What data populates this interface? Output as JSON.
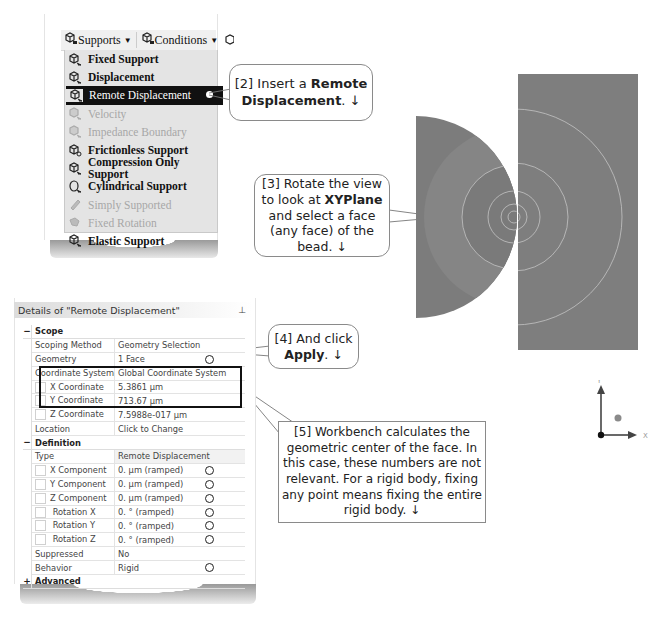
{
  "menu": {
    "toolbar": [
      {
        "label": "Supports",
        "icon": "supports-icon"
      },
      {
        "label": "Conditions",
        "icon": "conditions-icon"
      }
    ],
    "items": [
      {
        "label": "Fixed Support",
        "enabled": true,
        "selected": false
      },
      {
        "label": "Displacement",
        "enabled": true,
        "selected": false
      },
      {
        "label": "Remote Displacement",
        "enabled": true,
        "selected": true
      },
      {
        "label": "Velocity",
        "enabled": false,
        "selected": false
      },
      {
        "label": "Impedance Boundary",
        "enabled": false,
        "selected": false
      },
      {
        "label": "Frictionless Support",
        "enabled": true,
        "selected": false
      },
      {
        "label": "Compression Only Support",
        "enabled": true,
        "selected": false
      },
      {
        "label": "Cylindrical Support",
        "enabled": true,
        "selected": false
      },
      {
        "label": "Simply Supported",
        "enabled": false,
        "selected": false
      },
      {
        "label": "Fixed Rotation",
        "enabled": false,
        "selected": false
      },
      {
        "label": "Elastic Support",
        "enabled": true,
        "selected": false
      }
    ]
  },
  "callouts": {
    "c2": {
      "pre": "[2] Insert a ",
      "bold": "Remote Displacement",
      "post": ". ↓"
    },
    "c3": {
      "pre": "[3] Rotate the view to look at ",
      "bold": "XYPlane",
      "post": " and select a face (any face) of the bead. ↓"
    },
    "c4": {
      "pre": "[4] And click ",
      "bold": "Apply",
      "post": ". ↓"
    },
    "c5": {
      "text": "[5] Workbench calculates the geometric center of the face.  In this case, these numbers are not relevant. For a rigid body, fixing any point means fixing the entire rigid body. ↓"
    }
  },
  "details": {
    "title": "Details of \"Remote Displacement\"",
    "pin": "⊥",
    "scope": {
      "label": "Scope",
      "toggle": "−",
      "rows": [
        {
          "key": "Scoping Method",
          "value": "Geometry Selection"
        },
        {
          "key": "Geometry",
          "value": "1 Face"
        },
        {
          "key": "Coordinate System",
          "value": "Global Coordinate System"
        },
        {
          "key": "X Coordinate",
          "value": "5.3861 µm"
        },
        {
          "key": "Y Coordinate",
          "value": "713.67 µm"
        },
        {
          "key": "Z Coordinate",
          "value": "7.5988e-017 µm"
        },
        {
          "key": "Location",
          "value": "Click to Change"
        }
      ]
    },
    "definition": {
      "label": "Definition",
      "toggle": "−",
      "rows": [
        {
          "key": "Type",
          "value": "Remote Displacement"
        },
        {
          "key": "X Component",
          "value": "0. µm  (ramped)"
        },
        {
          "key": "Y Component",
          "value": "0. µm  (ramped)"
        },
        {
          "key": "Z Component",
          "value": "0. µm  (ramped)"
        },
        {
          "key": "Rotation X",
          "value": "0. °  (ramped)"
        },
        {
          "key": "Rotation Y",
          "value": "0. °  (ramped)"
        },
        {
          "key": "Rotation Z",
          "value": "0. °  (ramped)"
        },
        {
          "key": "Suppressed",
          "value": "No"
        },
        {
          "key": "Behavior",
          "value": "Rigid"
        }
      ]
    },
    "advanced": {
      "label": "Advanced",
      "toggle": "+"
    }
  },
  "triad": {
    "x_label": "X",
    "y_label": "Y"
  },
  "colors": {
    "selected_bg": "#111111",
    "model_dark": "#7b7b7b",
    "model_light": "#888888",
    "edge_lines": "#c8c8c8"
  }
}
